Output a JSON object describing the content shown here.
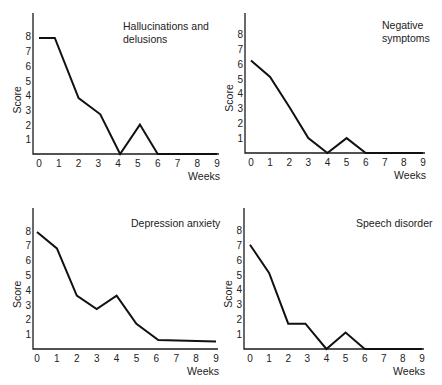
{
  "figure": {
    "panel_count": 4
  },
  "chart_data": [
    {
      "type": "line",
      "title": [
        "Hallucinations and",
        "delusions"
      ],
      "xlabel": "Weeks",
      "ylabel": "Score",
      "x_ticks": [
        0,
        1,
        2,
        3,
        4,
        5,
        6,
        7,
        8,
        9
      ],
      "y_ticks": [
        1,
        2,
        3,
        4,
        5,
        6,
        7,
        8
      ],
      "xlim": [
        0,
        9
      ],
      "ylim": [
        0,
        9
      ],
      "grid": false,
      "legend": "none",
      "x": [
        0,
        0.8,
        2,
        3.1,
        4.1,
        5.1,
        6,
        9
      ],
      "values": [
        7.9,
        7.9,
        3.8,
        2.7,
        0,
        2,
        0,
        0
      ],
      "layout": {
        "axisX": 33,
        "axisTop": 13,
        "baseY": 154,
        "x0": 39,
        "x9": 217,
        "unit": 14.7,
        "titleX": 123,
        "titleY": 30
      }
    },
    {
      "type": "line",
      "title": [
        "Negative",
        "symptoms"
      ],
      "xlabel": "Weeks",
      "ylabel": "Score",
      "x_ticks": [
        0,
        1,
        2,
        3,
        4,
        5,
        6,
        7,
        8,
        9
      ],
      "y_ticks": [
        1,
        2,
        3,
        4,
        5,
        6,
        7,
        8
      ],
      "xlim": [
        0,
        9
      ],
      "ylim": [
        0,
        9
      ],
      "grid": false,
      "legend": "none",
      "x": [
        0,
        1,
        2,
        3,
        4,
        5,
        6,
        9
      ],
      "values": [
        6.2,
        5.1,
        3.1,
        1,
        0,
        1,
        0,
        0
      ],
      "layout": {
        "axisX": 245,
        "axisTop": 13,
        "baseY": 153,
        "x0": 251,
        "x9": 423,
        "unit": 14.9,
        "titleX": 382,
        "titleY": 29
      }
    },
    {
      "type": "line",
      "title": [
        "Depression anxiety"
      ],
      "xlabel": "Weeks",
      "ylabel": "Score",
      "x_ticks": [
        0,
        1,
        2,
        3,
        4,
        5,
        6,
        7,
        8,
        9
      ],
      "y_ticks": [
        1,
        2,
        3,
        4,
        5,
        6,
        7,
        8
      ],
      "xlim": [
        0,
        9
      ],
      "ylim": [
        0,
        9
      ],
      "grid": false,
      "legend": "none",
      "x": [
        0,
        1,
        2,
        3,
        4,
        5,
        6.1,
        9
      ],
      "values": [
        7.9,
        6.8,
        3.6,
        2.7,
        3.6,
        1.7,
        0.6,
        0.5
      ],
      "layout": {
        "axisX": 33,
        "axisTop": 208,
        "baseY": 349,
        "x0": 37,
        "x9": 216,
        "unit": 14.8,
        "titleX": 131,
        "titleY": 227
      }
    },
    {
      "type": "line",
      "title": [
        "Speech disorder"
      ],
      "xlabel": "Weeks",
      "ylabel": "Score",
      "x_ticks": [
        0,
        1,
        2,
        3,
        4,
        5,
        6,
        7,
        8,
        9
      ],
      "y_ticks": [
        1,
        2,
        3,
        4,
        5,
        6,
        7,
        8
      ],
      "xlim": [
        0,
        9
      ],
      "ylim": [
        0,
        9
      ],
      "grid": false,
      "legend": "none",
      "x": [
        0,
        1,
        2,
        2.9,
        4,
        5,
        6,
        9
      ],
      "values": [
        7,
        5.1,
        1.7,
        1.7,
        0,
        1.1,
        0,
        0
      ],
      "layout": {
        "axisX": 244,
        "axisTop": 208,
        "baseY": 349,
        "x0": 250,
        "x9": 422,
        "unit": 14.9,
        "titleX": 356,
        "titleY": 227
      }
    }
  ]
}
